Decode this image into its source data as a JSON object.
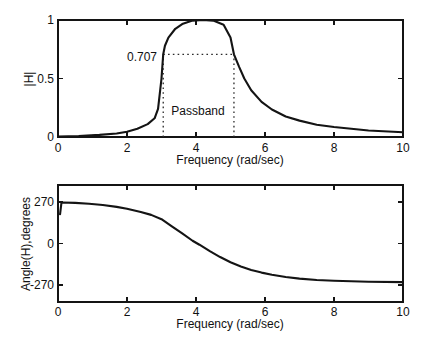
{
  "figure": {
    "background": "#ffffff",
    "ink_color": "#141414",
    "dotted_color": "#2a2a2a"
  },
  "chart_data": [
    {
      "type": "line",
      "title": "",
      "xlabel": "Frequency (rad/sec)",
      "ylabel": "|H|",
      "xlim": [
        0,
        10
      ],
      "ylim": [
        0,
        1
      ],
      "xticks": [
        0,
        2,
        4,
        6,
        8,
        10
      ],
      "yticks": [
        0,
        0.5,
        1
      ],
      "xtick_labels": [
        "0",
        "2",
        "4",
        "6",
        "8",
        "10"
      ],
      "ytick_labels": [
        "0",
        "0.5",
        "1"
      ],
      "grid": false,
      "legend": null,
      "annotations": {
        "cutoff_label": "0.707",
        "passband_label": "Passband",
        "cutoff_level": 0.707,
        "passband_low": 3.05,
        "passband_high": 5.1
      },
      "series": [
        {
          "name": "magnitude",
          "x": [
            0,
            0.6,
            1.2,
            1.7,
            2.0,
            2.3,
            2.6,
            2.8,
            2.9,
            3.0,
            3.05,
            3.1,
            3.2,
            3.4,
            3.6,
            3.9,
            4.2,
            4.5,
            4.8,
            5.0,
            5.1,
            5.25,
            5.4,
            5.6,
            5.9,
            6.2,
            6.6,
            7.0,
            7.5,
            8.0,
            9.0,
            10.0
          ],
          "y": [
            0.004,
            0.008,
            0.018,
            0.03,
            0.045,
            0.07,
            0.11,
            0.16,
            0.24,
            0.5,
            0.707,
            0.78,
            0.85,
            0.925,
            0.965,
            0.995,
            1.0,
            0.995,
            0.96,
            0.85,
            0.707,
            0.6,
            0.5,
            0.4,
            0.3,
            0.235,
            0.175,
            0.14,
            0.105,
            0.085,
            0.055,
            0.04
          ]
        }
      ]
    },
    {
      "type": "line",
      "title": "",
      "xlabel": "Frequency (rad/sec)",
      "ylabel": "Angle(H),degrees",
      "xlim": [
        0,
        10
      ],
      "ylim": [
        -380,
        380
      ],
      "xticks": [
        0,
        2,
        4,
        6,
        8,
        10
      ],
      "yticks": [
        270,
        0,
        -270
      ],
      "xtick_labels": [
        "0",
        "2",
        "4",
        "6",
        "8",
        "10"
      ],
      "ytick_labels": [
        "270",
        "0",
        "-270"
      ],
      "grid": false,
      "legend": null,
      "annotations": null,
      "series": [
        {
          "name": "phase",
          "x": [
            0.06,
            0.1,
            0.5,
            0.9,
            1.3,
            1.7,
            2.0,
            2.4,
            2.7,
            3.0,
            3.3,
            3.6,
            3.9,
            4.1,
            4.4,
            4.7,
            5.0,
            5.3,
            5.6,
            5.9,
            6.2,
            6.6,
            7.0,
            7.5,
            8.0,
            9.0,
            10.0
          ],
          "y": [
            190,
            266,
            264,
            258,
            250,
            238,
            226,
            205,
            186,
            158,
            112,
            66,
            18,
            -8,
            -50,
            -88,
            -122,
            -150,
            -172,
            -189,
            -203,
            -218,
            -228,
            -237,
            -242,
            -248,
            -251
          ]
        }
      ]
    }
  ]
}
